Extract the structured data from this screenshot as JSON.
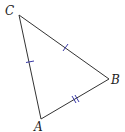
{
  "diagram": {
    "type": "triangle",
    "vertices": [
      {
        "label": "C",
        "x": 19,
        "y": 15,
        "label_x": 4,
        "label_y": 15
      },
      {
        "label": "B",
        "x": 109,
        "y": 79,
        "label_x": 112,
        "label_y": 84
      },
      {
        "label": "A",
        "x": 41,
        "y": 119,
        "label_x": 33,
        "label_y": 131
      }
    ],
    "sides": [
      {
        "name": "CA",
        "marks": 1
      },
      {
        "name": "CB",
        "marks": 1
      },
      {
        "name": "AB",
        "marks": 2
      }
    ],
    "colors": {
      "line": "#333333",
      "tick": "#3a3aa8",
      "label": "#222222"
    }
  }
}
